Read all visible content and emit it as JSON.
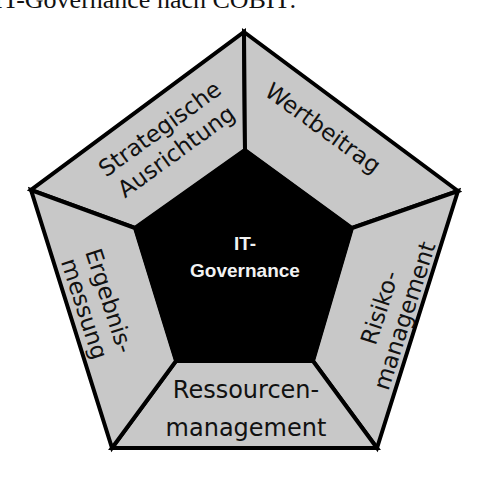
{
  "caption": "IT-Governance nach COBIT:",
  "colors": {
    "segment_fill": "#c8c8c8",
    "center_fill": "#000000",
    "stroke": "#000000",
    "center_text": "#f2f2f2",
    "segment_text": "#111111"
  },
  "center": {
    "line1": "IT-",
    "line2": "Governance"
  },
  "segments": [
    {
      "id": "strategische-ausrichtung",
      "line1": "Strategische",
      "line2": "Ausrichtung"
    },
    {
      "id": "wertbeitrag",
      "line1": "Wertbeitrag",
      "line2": ""
    },
    {
      "id": "risikomanagement",
      "line1": "Risiko-",
      "line2": "management"
    },
    {
      "id": "ressourcenmanagement",
      "line1": "Ressourcen-",
      "line2": "management"
    },
    {
      "id": "ergebnismessung",
      "line1": "Ergebnis-",
      "line2": "messung"
    }
  ]
}
